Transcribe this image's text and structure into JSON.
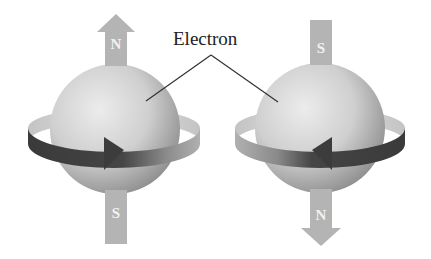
{
  "diagram": {
    "title_label": "Electron",
    "colors": {
      "background": "#ffffff",
      "sphere_light": "#e6e6e6",
      "sphere_dark": "#9a9a9a",
      "pole_arrow": "#b4b4b4",
      "ring_light": "#c8c8c8",
      "ring_dark": "#4a4a4a",
      "leader_line": "#333333",
      "label_text": "#222222"
    },
    "electrons": [
      {
        "name": "left-electron",
        "spin_direction": "counterclockwise-front-right",
        "top_pole": "N",
        "bottom_pole": "S",
        "pole_arrow_points": "up",
        "ring_arrow_points": "right"
      },
      {
        "name": "right-electron",
        "spin_direction": "clockwise-front-left",
        "top_pole": "S",
        "bottom_pole": "N",
        "pole_arrow_points": "down",
        "ring_arrow_points": "left"
      }
    ]
  }
}
